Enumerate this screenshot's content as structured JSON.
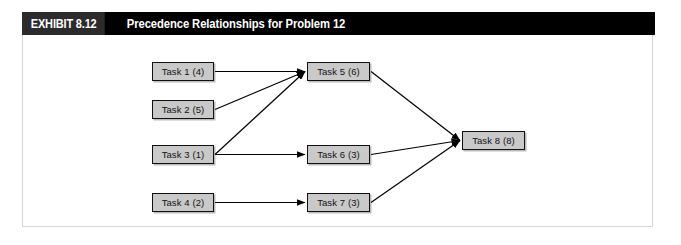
{
  "header": {
    "exhibit_number": "EXHIBIT 8.12",
    "title": "Precedence Relationships for Problem 12",
    "bar_color": "#000000",
    "number_box_color": "#2b2b2b",
    "text_color": "#ffffff"
  },
  "figure": {
    "frame_border_color": "#d5d5d5",
    "background_color": "#ffffff"
  },
  "diagram": {
    "type": "precedence-network",
    "node_fill_color": "#c9c9c9",
    "node_border_color": "#111111",
    "edge_color": "#000000",
    "nodes": [
      {
        "id": "task1",
        "label": "Task 1 (4)",
        "task": "Task 1",
        "duration": 4,
        "x": 152,
        "y": 62,
        "w": 62,
        "h": 19
      },
      {
        "id": "task2",
        "label": "Task 2 (5)",
        "task": "Task 2",
        "duration": 5,
        "x": 152,
        "y": 100,
        "w": 62,
        "h": 19
      },
      {
        "id": "task3",
        "label": "Task 3 (1)",
        "task": "Task 3",
        "duration": 1,
        "x": 152,
        "y": 145,
        "w": 62,
        "h": 19
      },
      {
        "id": "task4",
        "label": "Task 4 (2)",
        "task": "Task 4",
        "duration": 2,
        "x": 152,
        "y": 193,
        "w": 62,
        "h": 19
      },
      {
        "id": "task5",
        "label": "Task 5 (6)",
        "task": "Task 5",
        "duration": 6,
        "x": 307,
        "y": 62,
        "w": 63,
        "h": 19
      },
      {
        "id": "task6",
        "label": "Task 6 (3)",
        "task": "Task 6",
        "duration": 3,
        "x": 307,
        "y": 145,
        "w": 63,
        "h": 19
      },
      {
        "id": "task7",
        "label": "Task 7 (3)",
        "task": "Task 7",
        "duration": 3,
        "x": 307,
        "y": 193,
        "w": 63,
        "h": 19
      },
      {
        "id": "task8",
        "label": "Task 8 (8)",
        "task": "Task 8",
        "duration": 8,
        "x": 462,
        "y": 131,
        "w": 63,
        "h": 19
      }
    ],
    "edges": [
      {
        "from": "task1",
        "to": "task5"
      },
      {
        "from": "task2",
        "to": "task5"
      },
      {
        "from": "task3",
        "to": "task5"
      },
      {
        "from": "task3",
        "to": "task6"
      },
      {
        "from": "task4",
        "to": "task7"
      },
      {
        "from": "task5",
        "to": "task8"
      },
      {
        "from": "task6",
        "to": "task8"
      },
      {
        "from": "task7",
        "to": "task8"
      }
    ]
  }
}
